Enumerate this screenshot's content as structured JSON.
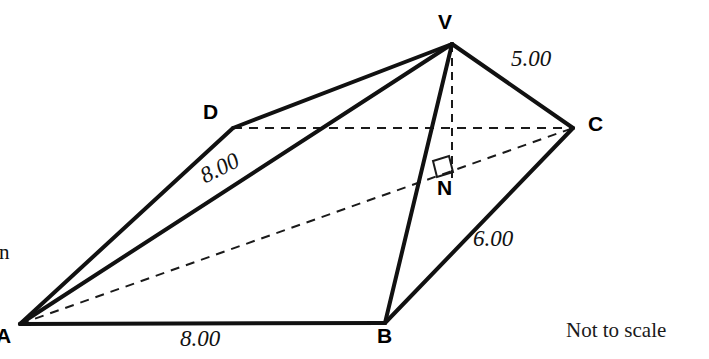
{
  "page": {
    "background_color": "#ffffff",
    "ink_color": "#1a1a1a",
    "width": 709,
    "height": 359
  },
  "prose": {
    "lines": [
      ".",
      "entre",
      "ents in",
      "tres."
    ],
    "note": "left-clipped question text"
  },
  "footer": {
    "not_to_scale": "Not to scale"
  },
  "diagram": {
    "type": "square-based-pyramid",
    "vertices": [
      {
        "id": "V",
        "label": "V",
        "x": 452,
        "y": 44,
        "label_x": 438,
        "label_y": 10,
        "role": "apex"
      },
      {
        "id": "D",
        "label": "D",
        "x": 233,
        "y": 128,
        "label_x": 203,
        "label_y": 100,
        "role": "base-corner"
      },
      {
        "id": "C",
        "label": "C",
        "x": 573,
        "y": 128,
        "label_x": 588,
        "label_y": 112,
        "role": "base-corner"
      },
      {
        "id": "A",
        "label": "A",
        "x": 20,
        "y": 324,
        "label_x": -4,
        "label_y": 324,
        "role": "base-corner"
      },
      {
        "id": "B",
        "label": "B",
        "x": 385,
        "y": 323,
        "label_x": 377,
        "label_y": 324,
        "role": "base-corner"
      },
      {
        "id": "N",
        "label": "N",
        "x": 452,
        "y": 173,
        "label_x": 437,
        "label_y": 176,
        "role": "foot-of-perpendicular"
      }
    ],
    "edges_solid": [
      {
        "from": "A",
        "to": "B",
        "name": "edge-ab"
      },
      {
        "from": "A",
        "to": "D",
        "name": "edge-ad"
      },
      {
        "from": "A",
        "to": "V",
        "name": "edge-av"
      },
      {
        "from": "D",
        "to": "V",
        "name": "edge-dv"
      },
      {
        "from": "V",
        "to": "C",
        "name": "edge-vc"
      },
      {
        "from": "V",
        "to": "B",
        "name": "edge-vb"
      },
      {
        "from": "B",
        "to": "C",
        "name": "edge-bc"
      }
    ],
    "edges_dashed": [
      {
        "from": "D",
        "to": "C",
        "name": "edge-dc-hidden"
      },
      {
        "from": "A",
        "to": "C",
        "name": "diagonal-ac-hidden"
      },
      {
        "from": "V",
        "to": "N",
        "name": "height-vn"
      }
    ],
    "right_angle": {
      "at": "N",
      "name": "right-angle-marker",
      "size": 16
    },
    "measurements": [
      {
        "id": "m-ab",
        "value": "8.00",
        "edge": "A-B",
        "x": 180,
        "y": 326,
        "rotation": 0
      },
      {
        "id": "m-av",
        "value": "8.00",
        "edge": "A-V",
        "x": 196,
        "y": 166,
        "rotation": -27
      },
      {
        "id": "m-vc",
        "value": "5.00",
        "edge": "V-C",
        "x": 511,
        "y": 46,
        "rotation": 0
      },
      {
        "id": "m-bc",
        "value": "6.00",
        "edge": "B-C",
        "x": 473,
        "y": 226,
        "rotation": 0
      }
    ]
  }
}
